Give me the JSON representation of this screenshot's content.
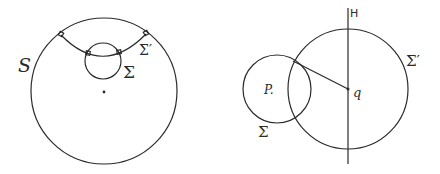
{
  "figures": [
    {
      "id": "left",
      "labels": {
        "outer_circle": "S",
        "inner_circle": "Σ",
        "orthogonal_arc": "Σ′"
      },
      "outer_circle": {
        "cx": 104,
        "cy": 91,
        "r": 73
      },
      "inner_circle": {
        "cx": 103,
        "cy": 61,
        "r": 18
      },
      "center_dot": {
        "x": 104,
        "y": 92
      },
      "right_angle_markers": 4
    },
    {
      "id": "right",
      "labels": {
        "line": "H",
        "small_circle": "Σ",
        "large_circle": "Σ′",
        "point_p": "P.",
        "point_q": "q"
      },
      "small_circle": {
        "cx": 277,
        "cy": 89,
        "r": 34
      },
      "large_circle": {
        "cx": 348,
        "cy": 89,
        "r": 60
      },
      "line_x": 348,
      "segment": {
        "x1": 293,
        "y1": 61,
        "x2": 348,
        "y2": 89
      }
    }
  ],
  "colors": {
    "ink": "#2a2a2a",
    "background": "#ffffff"
  }
}
